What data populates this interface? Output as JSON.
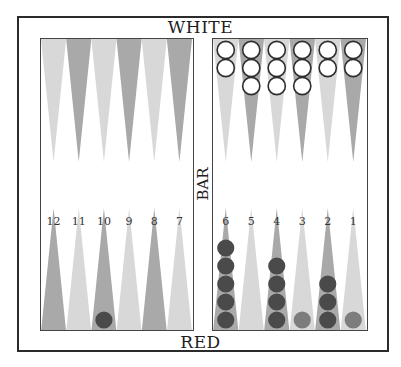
{
  "labels": {
    "top": "WHITE",
    "bottom": "RED",
    "bar": "BAR"
  },
  "colors": {
    "point_light": "#d8d8d8",
    "point_dark": "#a9a9a9",
    "white_checker_fill": "#ffffff",
    "white_checker_stroke": "#2e2e2e",
    "red_checker": "#4a4a4a",
    "red_checker_light": "#7d7d7d"
  },
  "point_numbers": {
    "left": [
      "12",
      "11",
      "10",
      "9",
      "8",
      "7"
    ],
    "right": [
      "6",
      "5",
      "4",
      "3",
      "2",
      "1"
    ]
  },
  "board": {
    "top_left": [
      {
        "point": 13,
        "shade": "light",
        "white": 0
      },
      {
        "point": 14,
        "shade": "dark",
        "white": 0
      },
      {
        "point": 15,
        "shade": "light",
        "white": 0
      },
      {
        "point": 16,
        "shade": "dark",
        "white": 0
      },
      {
        "point": 17,
        "shade": "light",
        "white": 0
      },
      {
        "point": 18,
        "shade": "dark",
        "white": 0
      }
    ],
    "top_right": [
      {
        "point": 19,
        "shade": "light",
        "white": 2
      },
      {
        "point": 20,
        "shade": "dark",
        "white": 3
      },
      {
        "point": 21,
        "shade": "light",
        "white": 3
      },
      {
        "point": 22,
        "shade": "dark",
        "white": 3
      },
      {
        "point": 23,
        "shade": "light",
        "white": 2
      },
      {
        "point": 24,
        "shade": "dark",
        "white": 2
      }
    ],
    "bottom_left": [
      {
        "point": 12,
        "shade": "dark",
        "red": 0,
        "red_light": 0
      },
      {
        "point": 11,
        "shade": "light",
        "red": 0,
        "red_light": 0
      },
      {
        "point": 10,
        "shade": "dark",
        "red": 1,
        "red_light": 0
      },
      {
        "point": 9,
        "shade": "light",
        "red": 0,
        "red_light": 0
      },
      {
        "point": 8,
        "shade": "dark",
        "red": 0,
        "red_light": 0
      },
      {
        "point": 7,
        "shade": "light",
        "red": 0,
        "red_light": 0
      }
    ],
    "bottom_right": [
      {
        "point": 6,
        "shade": "dark",
        "red": 5,
        "red_light": 0
      },
      {
        "point": 5,
        "shade": "light",
        "red": 0,
        "red_light": 0
      },
      {
        "point": 4,
        "shade": "dark",
        "red": 4,
        "red_light": 0
      },
      {
        "point": 3,
        "shade": "light",
        "red": 0,
        "red_light": 1
      },
      {
        "point": 2,
        "shade": "dark",
        "red": 3,
        "red_light": 0
      },
      {
        "point": 1,
        "shade": "light",
        "red": 0,
        "red_light": 1
      }
    ]
  }
}
